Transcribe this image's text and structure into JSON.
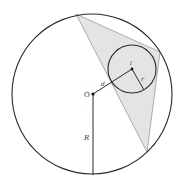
{
  "diagram": {
    "labels": {
      "circumcenter": "O",
      "incenter": "I",
      "distance": "d",
      "inradius": "r",
      "circumradius": "R"
    },
    "colors": {
      "stroke": "#2a2a2a",
      "triangle_fill": "#e4e4e4",
      "triangle_stroke": "#9a9a9a",
      "background": "#ffffff"
    },
    "circumcircle": {
      "cx": 92,
      "cy": 94,
      "r": 80
    },
    "incircle": {
      "cx": 132,
      "cy": 69,
      "r": 24
    },
    "triangle": [
      [
        76,
        14
      ],
      [
        160,
        52
      ],
      [
        147,
        152
      ]
    ]
  }
}
